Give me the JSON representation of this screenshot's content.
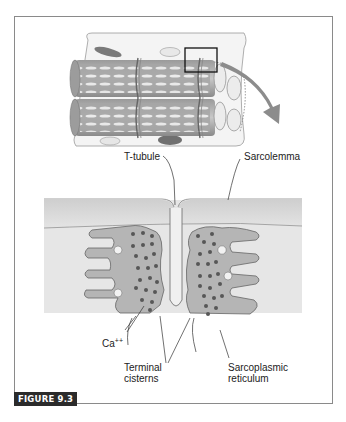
{
  "figure": {
    "label": "FIGURE 9.3"
  },
  "top_panel": {
    "description": "3D view of myofibrils within muscle fiber; box marks enlarged region",
    "callout_arrow": "arrow pointing from boxed region to detail view"
  },
  "labels": {
    "t_tubule": "T-tubule",
    "sarcolemma": "Sarcolemma",
    "calcium": "Ca++",
    "calcium_base": "Ca",
    "calcium_sup": "++",
    "terminal_cisterns_line1": "Terminal",
    "terminal_cisterns_line2": "cisterns",
    "sr_line1": "Sarcoplasmic",
    "sr_line2": "reticulum"
  },
  "colors": {
    "membrane_fill": "#d9d9d9",
    "sr_fill": "#b5b5b5",
    "dots": "#555555",
    "outline": "#555555",
    "arrow": "#8c8c8c",
    "label_bg": "#2b2b2b"
  }
}
